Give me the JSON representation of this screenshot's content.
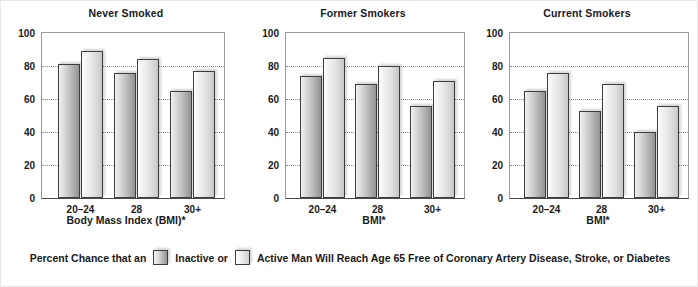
{
  "chart_data": {
    "type": "bar",
    "title": "Percent Chance that an Inactive or Active Man Will Reach Age 65 Free of Coronary Artery Disease, Stroke, or Diabetes",
    "categories": [
      "20–24",
      "28",
      "30+"
    ],
    "ylim": [
      0,
      100
    ],
    "yticks": [
      0,
      20,
      40,
      60,
      80,
      100
    ],
    "ylabel": "",
    "grid": true,
    "legend_position": "bottom",
    "panels": [
      {
        "title": "Never Smoked",
        "xlabel": "Body Mass Index (BMI)*",
        "series": [
          {
            "name": "Inactive",
            "values": [
              81,
              76,
              65
            ]
          },
          {
            "name": "Active",
            "values": [
              89,
              84,
              77
            ]
          }
        ]
      },
      {
        "title": "Former Smokers",
        "xlabel": "BMI*",
        "series": [
          {
            "name": "Inactive",
            "values": [
              74,
              69,
              56
            ]
          },
          {
            "name": "Active",
            "values": [
              85,
              80,
              71
            ]
          }
        ]
      },
      {
        "title": "Current Smokers",
        "xlabel": "BMI*",
        "series": [
          {
            "name": "Inactive",
            "values": [
              65,
              53,
              40
            ]
          },
          {
            "name": "Active",
            "values": [
              76,
              69,
              56
            ]
          }
        ]
      }
    ]
  },
  "panels": [
    {
      "title": "Never Smoked",
      "xlabel": "Body Mass Index (BMI)*",
      "yticks": [
        "100",
        "80",
        "60",
        "40",
        "20",
        "0"
      ],
      "xticks": [
        "20–24",
        "28",
        "30+"
      ]
    },
    {
      "title": "Former Smokers",
      "xlabel": "BMI*",
      "yticks": [
        "100",
        "80",
        "60",
        "40",
        "20",
        "0"
      ],
      "xticks": [
        "20–24",
        "28",
        "30+"
      ]
    },
    {
      "title": "Current Smokers",
      "xlabel": "BMI*",
      "yticks": [
        "100",
        "80",
        "60",
        "40",
        "20",
        "0"
      ],
      "xticks": [
        "20–24",
        "28",
        "30+"
      ]
    }
  ],
  "legend": {
    "lead_text": "Percent Chance that an",
    "inactive_label": "Inactive or",
    "active_label": "Active Man Will Reach Age 65 Free of Coronary Artery Disease, Stroke, or Diabetes",
    "inactive_swatch": "#a8a8a8",
    "active_swatch": "#dadada"
  }
}
